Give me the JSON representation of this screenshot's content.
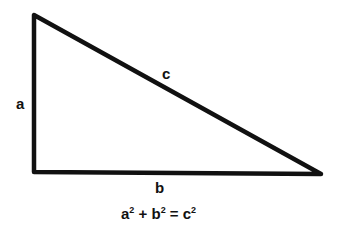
{
  "diagram": {
    "type": "right-triangle",
    "stroke_color": "#111111",
    "labels": {
      "side_a": "a",
      "side_b": "b",
      "side_c": "c"
    },
    "formula": {
      "term1": "a",
      "term2": "b",
      "term3": "c",
      "exponent": "2",
      "plus": "+",
      "equals": "="
    }
  }
}
